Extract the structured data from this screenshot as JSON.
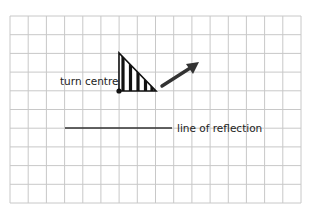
{
  "diagram": {
    "grid": {
      "columns": 16,
      "rows": 10,
      "left": 10,
      "top": 16,
      "right": 301,
      "bottom": 203,
      "line_color": "#c8c8c8"
    },
    "labels": {
      "turn_centre": "turn centre",
      "line_of_reflection": "line of reflection"
    },
    "shape": {
      "type": "right-triangle",
      "fill": "vertical-stripes",
      "vertices": [
        [
          119,
          53
        ],
        [
          119,
          91
        ],
        [
          156,
          91
        ]
      ],
      "stroke_color": "#111111"
    },
    "turn_centre_point": [
      119,
      91
    ],
    "arrow": {
      "from": [
        162,
        86
      ],
      "to": [
        198,
        63
      ],
      "color": "#333333"
    },
    "reflection_line": {
      "from": [
        65,
        128
      ],
      "to": [
        172,
        128
      ],
      "color": "#333333"
    }
  }
}
